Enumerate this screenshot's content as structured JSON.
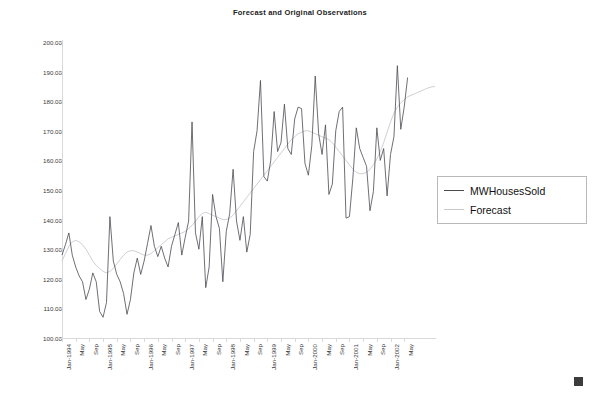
{
  "chart_data": {
    "type": "line",
    "title": "Forecast and Original Observations",
    "xlabel": "",
    "ylabel": "",
    "ylim": [
      100.0,
      200.0
    ],
    "ytick_labels": [
      "200.00",
      "190.00",
      "180.00",
      "170.00",
      "160.00",
      "150.00",
      "140.00",
      "130.00",
      "120.00",
      "110.00",
      "100.00"
    ],
    "ytick_values": [
      200,
      190,
      180,
      170,
      160,
      150,
      140,
      130,
      120,
      110,
      100
    ],
    "grid": false,
    "legend_position": "right",
    "x_axis_frequency": "monthly",
    "x_tick_labels": [
      "Jan-1994",
      "May",
      "Sep",
      "Jan-1995",
      "May",
      "Sep",
      "Jan-1996",
      "May",
      "Sep",
      "Jan-1997",
      "May",
      "Sep",
      "Jan-1998",
      "May",
      "Sep",
      "Jan-1999",
      "May",
      "Sep",
      "Jan-2000",
      "May",
      "Sep",
      "Jan-2001",
      "May",
      "Sep",
      "Jan-2002",
      "May"
    ],
    "x_start": "Jan-1994",
    "x_end": "May-2002",
    "series": [
      {
        "name": "MWHousesSold",
        "color": "#4a4a52",
        "values": [
          128.0,
          131.5,
          135.5,
          128.0,
          124.0,
          121.0,
          119.0,
          113.0,
          116.5,
          122.0,
          119.0,
          109.0,
          107.0,
          112.0,
          141.0,
          126.0,
          121.5,
          119.0,
          115.0,
          108.0,
          113.0,
          122.0,
          127.0,
          121.5,
          126.0,
          132.0,
          138.0,
          131.0,
          127.5,
          131.0,
          127.0,
          124.0,
          131.0,
          135.0,
          139.0,
          128.0,
          134.0,
          139.5,
          173.0,
          135.5,
          130.0,
          141.0,
          117.0,
          124.0,
          148.5,
          141.0,
          137.0,
          119.0,
          136.0,
          142.0,
          157.0,
          139.5,
          133.0,
          141.0,
          129.0,
          135.0,
          163.0,
          170.0,
          187.0,
          154.5,
          153.0,
          160.0,
          176.5,
          163.0,
          166.0,
          179.0,
          164.0,
          162.0,
          174.0,
          178.0,
          177.5,
          159.0,
          155.0,
          165.0,
          188.5,
          169.0,
          162.0,
          172.0,
          148.5,
          152.0,
          170.0,
          176.5,
          178.0,
          140.5,
          141.0,
          154.0,
          171.0,
          164.0,
          161.0,
          158.0,
          143.0,
          149.5,
          171.0,
          160.0,
          164.0,
          148.0,
          162.0,
          168.0,
          192.0,
          170.5,
          178.0,
          188.0
        ]
      },
      {
        "name": "Forecast",
        "color": "#c9c9cf",
        "values": [
          126.0,
          128.5,
          131.0,
          132.5,
          133.0,
          132.5,
          131.5,
          130.0,
          128.0,
          126.0,
          124.5,
          123.5,
          122.5,
          122.0,
          122.5,
          123.5,
          125.0,
          126.5,
          128.0,
          129.0,
          129.5,
          129.5,
          129.0,
          128.5,
          128.0,
          128.0,
          128.5,
          129.5,
          130.5,
          131.5,
          132.5,
          133.5,
          134.0,
          134.5,
          135.0,
          135.5,
          136.0,
          137.0,
          138.0,
          139.5,
          141.0,
          142.0,
          142.5,
          142.0,
          141.5,
          141.0,
          140.5,
          140.0,
          140.0,
          140.5,
          141.5,
          143.0,
          144.5,
          146.0,
          147.5,
          149.0,
          150.5,
          152.0,
          153.5,
          155.0,
          156.5,
          158.0,
          159.5,
          161.0,
          162.5,
          164.0,
          165.5,
          167.0,
          168.0,
          169.0,
          169.5,
          170.0,
          170.0,
          169.5,
          169.0,
          168.5,
          168.0,
          167.5,
          167.0,
          166.0,
          164.5,
          163.0,
          161.5,
          160.0,
          158.5,
          157.0,
          156.0,
          155.5,
          155.5,
          156.0,
          157.0,
          158.5,
          160.5,
          163.0,
          166.0,
          169.5,
          173.0,
          176.0,
          178.0,
          179.5,
          180.5,
          181.5,
          182.0,
          182.5,
          183.0,
          183.5,
          184.0,
          184.5,
          184.8,
          185.0
        ]
      }
    ]
  },
  "legend": {
    "items": [
      {
        "label": "MWHousesSold"
      },
      {
        "label": "Forecast"
      }
    ]
  }
}
